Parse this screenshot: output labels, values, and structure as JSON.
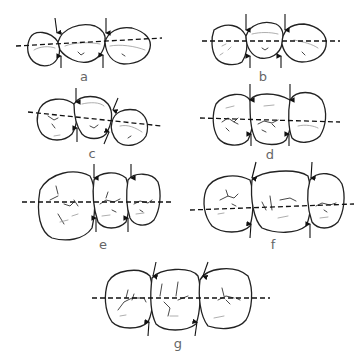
{
  "figure": {
    "panels": [
      {
        "id": "a",
        "label": "a"
      },
      {
        "id": "b",
        "label": "b"
      },
      {
        "id": "c",
        "label": "c"
      },
      {
        "id": "d",
        "label": "d"
      },
      {
        "id": "e",
        "label": "e"
      },
      {
        "id": "f",
        "label": "f"
      },
      {
        "id": "g",
        "label": "g"
      }
    ],
    "colors": {
      "line": "#222222",
      "label": "#666666",
      "background": "#ffffff"
    }
  }
}
